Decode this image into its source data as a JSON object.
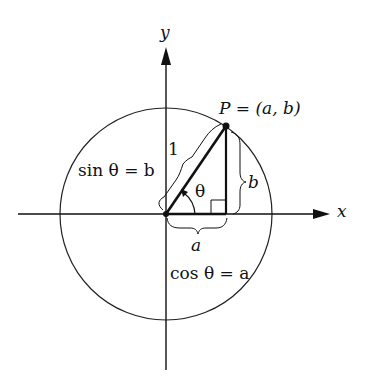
{
  "diagram": {
    "axes": {
      "x_label": "x",
      "y_label": "y"
    },
    "point_label": "P = (a, b)",
    "hypotenuse_label": "1",
    "angle_label": "θ",
    "opposite_label": "b",
    "adjacent_label": "a",
    "sin_label": "sin θ = b",
    "cos_label": "cos θ = a",
    "colors": {
      "ink": "#111111",
      "background": "#ffffff"
    }
  }
}
